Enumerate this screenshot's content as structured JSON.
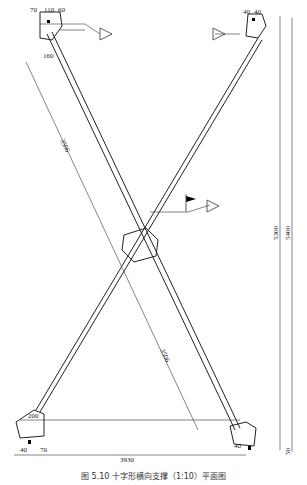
{
  "caption": "图 5.10  十字形横向支撑（1:10）平面图",
  "dimensions": {
    "top_left": [
      "70",
      "110",
      "60",
      "40",
      "40",
      "50",
      "120",
      "70",
      "160",
      "100"
    ],
    "top_right": [
      "40",
      "40",
      "50"
    ],
    "center": [
      "120",
      "80",
      "90",
      "100",
      "60",
      "90"
    ],
    "bottom_left": [
      "200",
      "120",
      "110",
      "30",
      "40",
      "40",
      "40",
      "70",
      "40",
      "70",
      "200"
    ],
    "bottom_right": [
      "40",
      "40",
      "120"
    ],
    "diag_upper": "3506",
    "diag_lower": "3506",
    "overall_width": "3930",
    "height_outer": "5400",
    "height_inner": "5300",
    "side_small": "50"
  }
}
